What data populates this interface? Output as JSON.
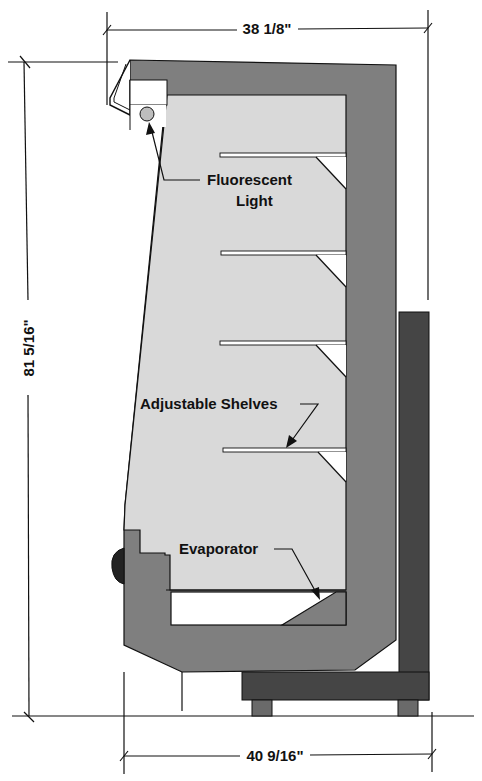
{
  "diagram": {
    "type": "cross-section",
    "colors": {
      "cabinet_wall": "#7f7f7f",
      "interior": "#d9d9d9",
      "base_dark": "#454545",
      "feet": "#6a6a6a",
      "light_fixture": "#bdbdbd",
      "line": "#111111",
      "background": "#ffffff"
    },
    "dimensions": {
      "top_width": "38 1/8\"",
      "height": "81 5/16\"",
      "bottom_width": "40 9/16\""
    },
    "callouts": {
      "light_line1": "Fluorescent",
      "light_line2": "Light",
      "shelves": "Adjustable Shelves",
      "evaporator": "Evaporator"
    },
    "shelf_count": 4
  }
}
